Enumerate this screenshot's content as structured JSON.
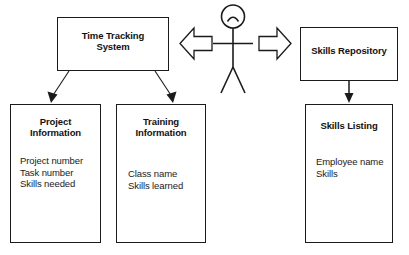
{
  "diagram": {
    "type": "system-interaction-diagram",
    "background_color": "#ffffff",
    "stroke_color": "#1b1b1b",
    "text_color": "#111111",
    "nodes": {
      "time_tracking_system": {
        "title_line1": "Time Tracking",
        "title_line2": "System",
        "fields": []
      },
      "project_information": {
        "title_line1": "Project",
        "title_line2": "Information",
        "fields": [
          "Project number",
          "Task number",
          "Skills needed"
        ]
      },
      "training_information": {
        "title_line1": "Training",
        "title_line2": "Information",
        "fields": [
          "Class name",
          "Skills learned"
        ]
      },
      "skills_repository": {
        "title_line1": "Skills Repository",
        "title_line2": "",
        "fields": []
      },
      "skills_listing": {
        "title_line1": "Skills Listing",
        "title_line2": "",
        "fields": [
          "Employee name",
          "Skills"
        ]
      }
    },
    "actor": {
      "name": "user-stick-figure",
      "face": "arc"
    },
    "connectors": [
      {
        "name": "time-tracking-to-project-information",
        "style": "thin-diagonal-arrow",
        "from": "time_tracking_system",
        "to": "project_information"
      },
      {
        "name": "time-tracking-to-training-information",
        "style": "thin-diagonal-arrow",
        "from": "time_tracking_system",
        "to": "training_information"
      },
      {
        "name": "skills-repository-to-skills-listing",
        "style": "vertical-arrow",
        "from": "skills_repository",
        "to": "skills_listing"
      },
      {
        "name": "actor-to-time-tracking-system",
        "style": "hollow-block-arrow-left",
        "direction": "left"
      },
      {
        "name": "actor-to-skills-repository",
        "style": "hollow-block-arrow-right",
        "direction": "right"
      }
    ]
  }
}
